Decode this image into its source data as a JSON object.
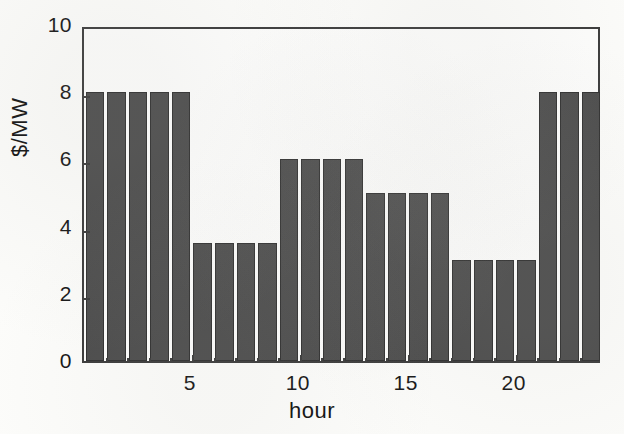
{
  "chart_data": {
    "type": "bar",
    "title": "",
    "xlabel": "hour",
    "ylabel": "$/MW",
    "categories": [
      1,
      2,
      3,
      4,
      5,
      6,
      7,
      8,
      9,
      10,
      11,
      12,
      13,
      14,
      15,
      16,
      17,
      18,
      19,
      20,
      21,
      22,
      23,
      24
    ],
    "values": [
      8,
      8,
      8,
      8,
      8,
      3.5,
      3.5,
      3.5,
      3.5,
      6,
      6,
      6,
      6,
      5,
      5,
      5,
      5,
      3,
      3,
      3,
      3,
      8,
      8,
      8
    ],
    "xlim": [
      0,
      24
    ],
    "ylim": [
      0,
      10
    ],
    "xticks": [
      5,
      10,
      15,
      20
    ],
    "xtick_labels": [
      "5",
      "10",
      "15",
      "20"
    ],
    "yticks": [
      0,
      2,
      4,
      6,
      8,
      10
    ],
    "ytick_labels": [
      "0",
      "2",
      "4",
      "6",
      "8",
      "10"
    ],
    "grid": false,
    "legend": null,
    "bar_color": "#4b4b4b",
    "bar_edge_color": "#2e2e2e",
    "axis_color": "#3a3a3a",
    "background_color": "#fcfcfa"
  }
}
